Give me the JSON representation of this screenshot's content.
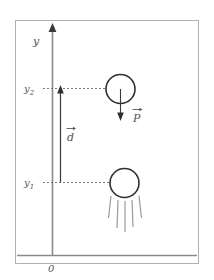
{
  "figure": {
    "frame": {
      "border_color": "#b0b0b0",
      "background": "#ffffff"
    },
    "axis": {
      "vertical_label": "y",
      "origin_label": "0",
      "line_color": "#8a8a8a",
      "arrow_color": "#3a3a3a"
    },
    "ticks": [
      {
        "name": "upper",
        "label": "y",
        "subscript": "2"
      },
      {
        "name": "lower",
        "label": "y",
        "subscript": "1"
      }
    ],
    "vectors": [
      {
        "name": "weight",
        "label": "P",
        "accent": "→",
        "direction": "down",
        "color": "#3a3a3a"
      },
      {
        "name": "displacement",
        "label": "d",
        "accent": "→",
        "direction": "up",
        "color": "#3a3a3a"
      }
    ],
    "bodies": [
      {
        "name": "ball-upper",
        "shape": "circle",
        "stroke": "#2f2f2f"
      },
      {
        "name": "ball-lower",
        "shape": "circle",
        "stroke": "#2f2f2f"
      }
    ],
    "splash": {
      "name": "impact-lines",
      "count": 5,
      "color": "#9a9a9a"
    },
    "ground": {
      "name": "ground-line",
      "color": "#8a8a8a"
    },
    "dashed_guides": {
      "color": "#7a7a7a"
    }
  }
}
